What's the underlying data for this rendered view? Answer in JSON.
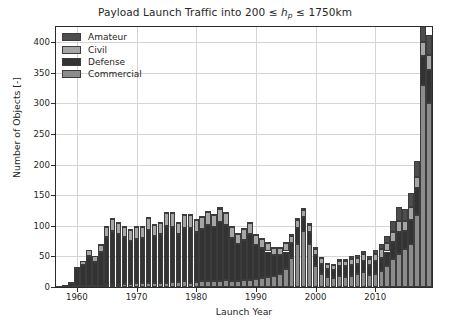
{
  "chart_data": {
    "type": "bar",
    "stacked": true,
    "title_parts": {
      "prefix": "Payload Launch Traffic into 200 ",
      "op1": "≤ ",
      "var": "h",
      "sub": "p",
      "op2": " ≤ ",
      "suffix": " 1750km"
    },
    "xlabel": "Launch Year",
    "ylabel": "Number of Objects [-]",
    "xlim": [
      1956.5,
      2019.5
    ],
    "ylim": [
      0,
      425
    ],
    "ytick_values": [
      0,
      50,
      100,
      150,
      200,
      250,
      300,
      350,
      400
    ],
    "ytick_labels": [
      "0",
      "50",
      "100",
      "150",
      "200",
      "250",
      "300",
      "350",
      "400"
    ],
    "xtick_values": [
      1960,
      1970,
      1980,
      1990,
      2000,
      2010
    ],
    "xtick_labels": [
      "1960",
      "1970",
      "1980",
      "1990",
      "2000",
      "2010"
    ],
    "grid": true,
    "legend_position": "upper left",
    "series_order": [
      "Commercial",
      "Defense",
      "Civil",
      "Amateur"
    ],
    "legend_entries": [
      {
        "name": "Amateur",
        "color": "#4d4d4d"
      },
      {
        "name": "Civil",
        "color": "#a6a6a6"
      },
      {
        "name": "Defense",
        "color": "#333333"
      },
      {
        "name": "Commercial",
        "color": "#8c8c8c"
      }
    ],
    "categories": [
      1957,
      1958,
      1959,
      1960,
      1961,
      1962,
      1963,
      1964,
      1965,
      1966,
      1967,
      1968,
      1969,
      1970,
      1971,
      1972,
      1973,
      1974,
      1975,
      1976,
      1977,
      1978,
      1979,
      1980,
      1981,
      1982,
      1983,
      1984,
      1985,
      1986,
      1987,
      1988,
      1989,
      1990,
      1991,
      1992,
      1993,
      1994,
      1995,
      1996,
      1997,
      1998,
      1999,
      2000,
      2001,
      2002,
      2003,
      2004,
      2005,
      2006,
      2007,
      2008,
      2009,
      2010,
      2011,
      2012,
      2013,
      2014,
      2015,
      2016,
      2017,
      2018,
      2019
    ],
    "series": [
      {
        "name": "Commercial",
        "color": "#8c8c8c",
        "values": [
          0,
          0,
          0,
          1,
          1,
          2,
          1,
          2,
          3,
          4,
          4,
          5,
          5,
          6,
          6,
          7,
          6,
          6,
          7,
          8,
          8,
          9,
          7,
          8,
          9,
          9,
          10,
          10,
          11,
          10,
          9,
          11,
          12,
          13,
          14,
          16,
          18,
          22,
          30,
          48,
          70,
          92,
          70,
          34,
          22,
          16,
          14,
          18,
          16,
          18,
          22,
          24,
          20,
          22,
          26,
          34,
          46,
          54,
          62,
          70,
          118,
          330,
          300
        ]
      },
      {
        "name": "Defense",
        "color": "#333333",
        "values": [
          1,
          3,
          6,
          28,
          35,
          48,
          40,
          55,
          78,
          88,
          82,
          76,
          70,
          72,
          74,
          86,
          78,
          80,
          92,
          90,
          78,
          88,
          90,
          82,
          86,
          92,
          88,
          96,
          90,
          70,
          62,
          66,
          74,
          56,
          50,
          42,
          34,
          30,
          28,
          24,
          26,
          22,
          20,
          18,
          16,
          14,
          14,
          16,
          18,
          18,
          16,
          18,
          16,
          20,
          22,
          24,
          28,
          36,
          30,
          40,
          44,
          48,
          54
        ]
      },
      {
        "name": "Civil",
        "color": "#a6a6a6",
        "values": [
          0,
          1,
          2,
          4,
          6,
          10,
          9,
          12,
          18,
          20,
          20,
          18,
          18,
          20,
          18,
          20,
          18,
          20,
          22,
          24,
          20,
          22,
          22,
          20,
          20,
          22,
          20,
          22,
          20,
          18,
          16,
          18,
          18,
          16,
          14,
          14,
          12,
          12,
          14,
          12,
          14,
          12,
          12,
          10,
          9,
          8,
          8,
          9,
          9,
          10,
          10,
          12,
          10,
          12,
          14,
          14,
          16,
          18,
          16,
          20,
          18,
          22,
          26
        ]
      },
      {
        "name": "Amateur",
        "color": "#4d4d4d",
        "values": [
          0,
          0,
          0,
          0,
          0,
          0,
          0,
          1,
          1,
          1,
          1,
          1,
          1,
          1,
          1,
          1,
          1,
          1,
          1,
          1,
          1,
          1,
          1,
          1,
          1,
          2,
          2,
          2,
          2,
          2,
          2,
          2,
          2,
          2,
          2,
          2,
          2,
          2,
          2,
          3,
          3,
          3,
          3,
          3,
          2,
          2,
          2,
          3,
          3,
          4,
          4,
          5,
          4,
          6,
          8,
          12,
          18,
          22,
          20,
          24,
          26,
          28,
          32
        ]
      }
    ],
    "totals": [
      1,
      4,
      8,
      33,
      42,
      60,
      50,
      70,
      100,
      113,
      107,
      100,
      94,
      99,
      99,
      114,
      103,
      107,
      122,
      123,
      107,
      120,
      120,
      111,
      116,
      125,
      120,
      130,
      123,
      100,
      89,
      97,
      106,
      87,
      80,
      74,
      66,
      66,
      74,
      86,
      113,
      129,
      105,
      65,
      49,
      40,
      38,
      46,
      46,
      50,
      52,
      59,
      50,
      60,
      70,
      84,
      108,
      130,
      128,
      154,
      206,
      428,
      412
    ]
  }
}
